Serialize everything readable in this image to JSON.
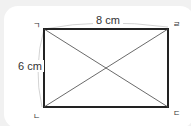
{
  "figure": {
    "type": "rectangle-with-diagonals",
    "width_label": "8 cm",
    "height_label": "6 cm",
    "vertices": {
      "top_left": "ㄱ",
      "bottom_left": "ㄴ",
      "bottom_right": "ㄷ",
      "top_right": "ㄹ"
    }
  }
}
